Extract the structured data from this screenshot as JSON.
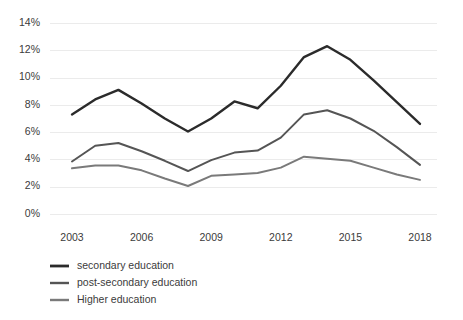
{
  "chart_data": {
    "type": "line",
    "title": "",
    "subtitle": "",
    "xlabel": "",
    "ylabel": "",
    "ylim": [
      0,
      14
    ],
    "xlim": [
      2003,
      2018
    ],
    "grid": true,
    "grid_color": "#ebebeb",
    "background": "#ffffff",
    "legend_position": "bottom-left",
    "y_ticks": [
      "0%",
      "2%",
      "4%",
      "6%",
      "8%",
      "10%",
      "12%",
      "14%"
    ],
    "y_tick_values": [
      0,
      2,
      4,
      6,
      8,
      10,
      12,
      14
    ],
    "x_ticks": [
      "2003",
      "2006",
      "2009",
      "2012",
      "2015",
      "2018"
    ],
    "x_tick_values": [
      2003,
      2006,
      2009,
      2012,
      2015,
      2018
    ],
    "x": [
      2003,
      2004,
      2005,
      2006,
      2007,
      2008,
      2009,
      2010,
      2011,
      2012,
      2013,
      2014,
      2015,
      2016,
      2017,
      2018
    ],
    "series": [
      {
        "name": "secondary education",
        "color": "#2b2b2b",
        "width": 2.4,
        "values": [
          7.3,
          8.4,
          9.1,
          8.1,
          7.0,
          6.05,
          7.0,
          8.25,
          7.75,
          9.4,
          11.5,
          12.3,
          11.3,
          9.8,
          8.2,
          6.6
        ]
      },
      {
        "name": "post-secondary education",
        "color": "#555555",
        "width": 2.0,
        "values": [
          3.85,
          5.0,
          5.2,
          4.6,
          3.9,
          3.15,
          3.95,
          4.5,
          4.65,
          5.6,
          7.3,
          7.6,
          7.0,
          6.1,
          4.9,
          3.6
        ]
      },
      {
        "name": "Higher education",
        "color": "#7a7a7a",
        "width": 2.0,
        "values": [
          3.35,
          3.55,
          3.55,
          3.2,
          2.6,
          2.05,
          2.8,
          2.9,
          3.0,
          3.4,
          4.2,
          4.05,
          3.9,
          3.4,
          2.9,
          2.5
        ]
      }
    ]
  },
  "legend": {
    "items": [
      {
        "label": "secondary education"
      },
      {
        "label": "post-secondary education"
      },
      {
        "label": "Higher education"
      }
    ]
  }
}
